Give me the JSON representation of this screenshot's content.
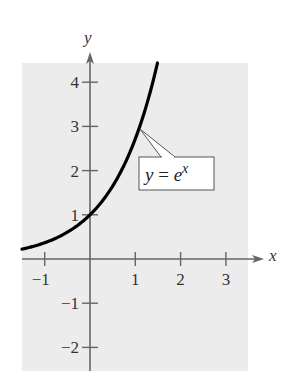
{
  "chart_data": {
    "type": "line",
    "title": "",
    "xlabel": "x",
    "ylabel": "y",
    "xlim": [
      -1.5,
      3.6
    ],
    "ylim": [
      -2.5,
      4.45
    ],
    "x_ticks": [
      -1,
      1,
      2,
      3
    ],
    "x_tick_labels": [
      "−1",
      "1",
      "2",
      "3"
    ],
    "y_ticks": [
      4,
      3,
      2,
      1,
      -1,
      -2
    ],
    "y_tick_labels": [
      "4",
      "3",
      "2",
      "1",
      "−1",
      "−2"
    ],
    "grid": false,
    "legend": "none",
    "series": [
      {
        "name": "y = e^x",
        "function": "exp(x)",
        "x": [
          -1.5,
          -1,
          -0.5,
          0,
          0.5,
          1,
          1.1,
          1.25,
          1.49
        ],
        "y": [
          0.22,
          0.37,
          0.61,
          1.0,
          1.65,
          2.72,
          3.0,
          3.49,
          4.44
        ],
        "color": "#000000"
      }
    ],
    "annotations": [
      {
        "text": "y = e^x",
        "points_to": [
          1.1,
          3.0
        ],
        "box": true
      }
    ]
  },
  "labels": {
    "x_axis": "x",
    "y_axis": "y",
    "callout_y": "y",
    "callout_eq": " = ",
    "callout_e": "e",
    "callout_exp": "x"
  },
  "colors": {
    "plot_bg": "#ececec",
    "axis": "#666666",
    "curve": "#000000",
    "callout_border": "#555555",
    "callout_bg": "#ffffff"
  }
}
